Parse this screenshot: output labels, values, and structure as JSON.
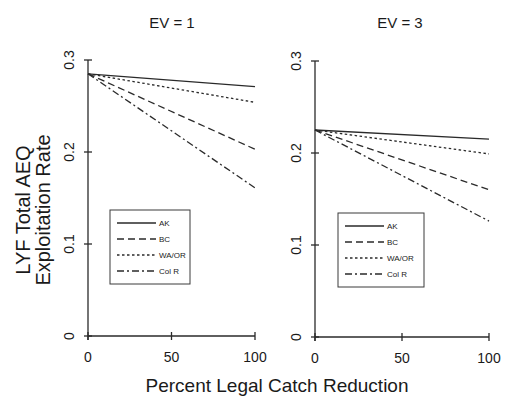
{
  "figure": {
    "ylabel_line1": "LYF Total AEQ",
    "ylabel_line2": "Exploitation Rate",
    "xlabel": "Percent Legal Catch Reduction"
  },
  "chart_data": [
    {
      "type": "line",
      "title": "EV = 1",
      "xlabel": "Percent Legal Catch Reduction",
      "ylabel": "LYF Total AEQ Exploitation Rate",
      "x": [
        0,
        100
      ],
      "xlim": [
        0,
        100
      ],
      "ylim": [
        0,
        0.3
      ],
      "xticks": [
        "0",
        "50",
        "100"
      ],
      "yticks": [
        "0",
        "0.1",
        "0.2",
        "0.3"
      ],
      "grid": false,
      "legend_position": "lower-left inside",
      "series": [
        {
          "name": "AK",
          "style": "solid",
          "values": [
            0.285,
            0.271
          ]
        },
        {
          "name": "BC",
          "style": "dashed",
          "values": [
            0.285,
            0.203
          ]
        },
        {
          "name": "WA/OR",
          "style": "dotted",
          "values": [
            0.285,
            0.254
          ]
        },
        {
          "name": "Col R",
          "style": "dash-dot",
          "values": [
            0.285,
            0.161
          ]
        }
      ]
    },
    {
      "type": "line",
      "title": "EV = 3",
      "xlabel": "Percent Legal Catch Reduction",
      "ylabel": "LYF Total AEQ Exploitation Rate",
      "x": [
        0,
        100
      ],
      "xlim": [
        0,
        100
      ],
      "ylim": [
        0,
        0.3
      ],
      "xticks": [
        "0",
        "50",
        "100"
      ],
      "yticks": [
        "0",
        "0.1",
        "0.2",
        "0.3"
      ],
      "grid": false,
      "legend_position": "lower-left inside",
      "series": [
        {
          "name": "AK",
          "style": "solid",
          "values": [
            0.225,
            0.215
          ]
        },
        {
          "name": "BC",
          "style": "dashed",
          "values": [
            0.225,
            0.16
          ]
        },
        {
          "name": "WA/OR",
          "style": "dotted",
          "values": [
            0.225,
            0.199
          ]
        },
        {
          "name": "Col R",
          "style": "dash-dot",
          "values": [
            0.225,
            0.126
          ]
        }
      ]
    }
  ]
}
